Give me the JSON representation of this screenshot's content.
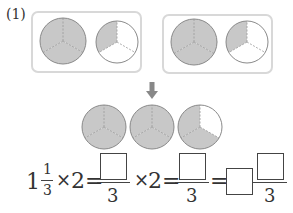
{
  "problem_label": "(1)",
  "colors": {
    "shade": "#c8c8c8",
    "outline": "#8a8a8a",
    "box_border": "#d8d8d8",
    "arrow": "#888888"
  },
  "groups": [
    {
      "pies": [
        {
          "shaded_thirds": 3
        },
        {
          "shaded_thirds": 1
        }
      ]
    },
    {
      "pies": [
        {
          "shaded_thirds": 3
        },
        {
          "shaded_thirds": 1
        }
      ]
    }
  ],
  "result_row": {
    "pies": [
      {
        "shaded_thirds": 3
      },
      {
        "shaded_thirds": 3
      },
      {
        "shaded_thirds": 2
      }
    ]
  },
  "equation": {
    "whole": "1",
    "numerator": "1",
    "denominator": "3",
    "times": "×",
    "multiplier": "2",
    "equals": "=",
    "denominator2": "3",
    "denominator3": "3",
    "blank": ""
  }
}
